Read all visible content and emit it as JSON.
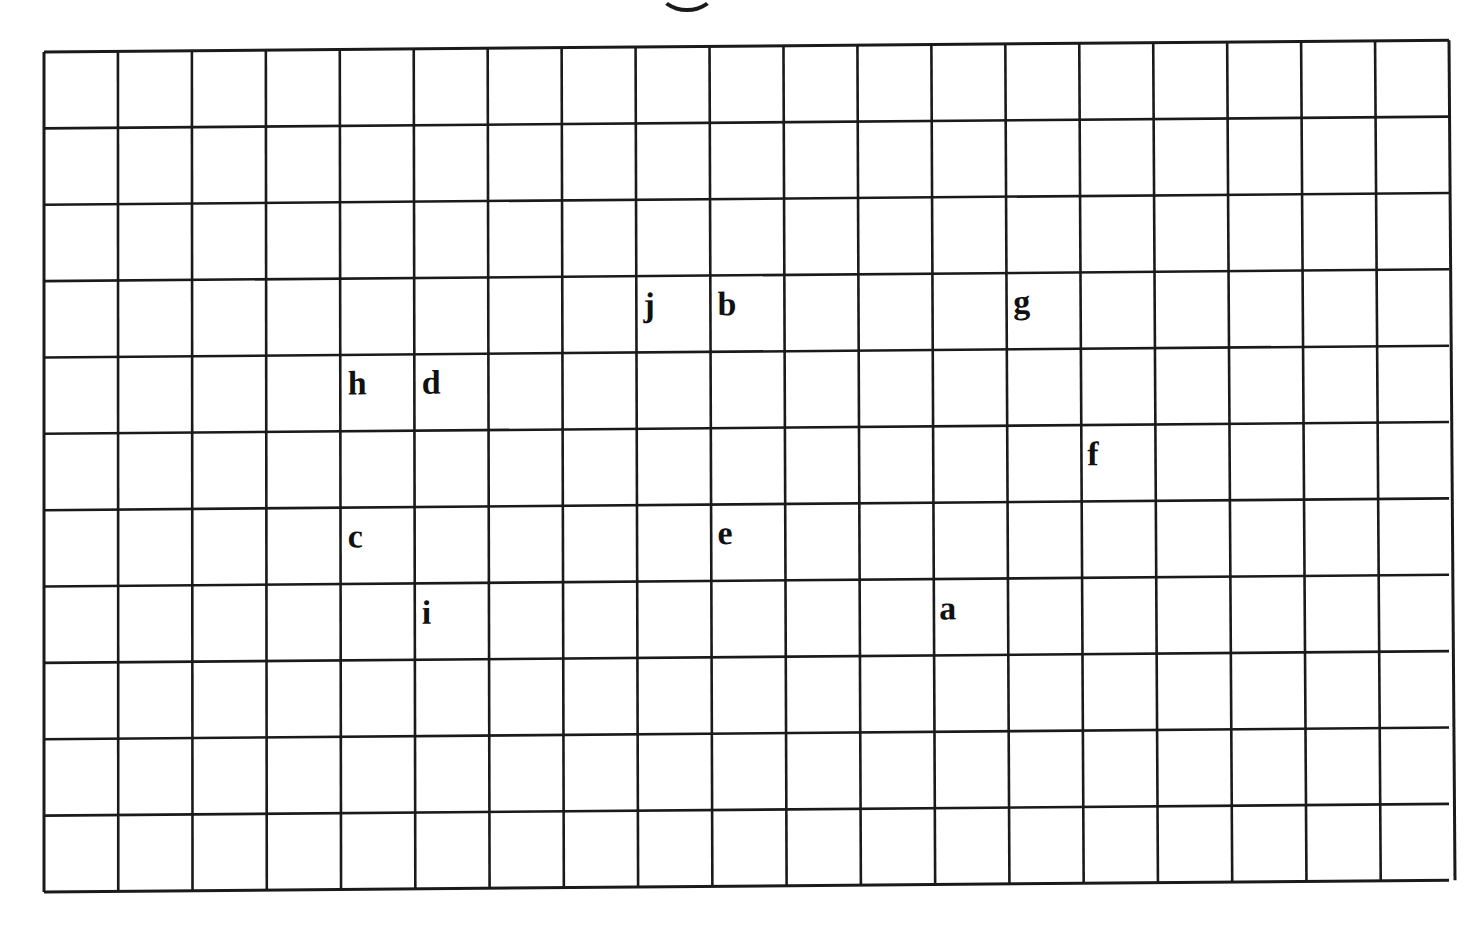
{
  "grid": {
    "columns": 19,
    "rows": 11,
    "line_color": "#1a1a1a",
    "background": "#ffffff"
  },
  "labels": [
    {
      "text": "j",
      "col": 8,
      "row": 3
    },
    {
      "text": "b",
      "col": 9,
      "row": 3
    },
    {
      "text": "g",
      "col": 13,
      "row": 3
    },
    {
      "text": "h",
      "col": 4,
      "row": 4
    },
    {
      "text": "d",
      "col": 5,
      "row": 4
    },
    {
      "text": "f",
      "col": 14,
      "row": 5
    },
    {
      "text": "c",
      "col": 4,
      "row": 6
    },
    {
      "text": "e",
      "col": 9,
      "row": 6
    },
    {
      "text": "i",
      "col": 5,
      "row": 7
    },
    {
      "text": "a",
      "col": 12,
      "row": 7
    }
  ],
  "label_map": {
    "a": "a",
    "b": "b",
    "c": "c",
    "d": "d",
    "e": "e",
    "f": "f",
    "g": "g",
    "h": "h",
    "i": "i",
    "j": "j"
  }
}
